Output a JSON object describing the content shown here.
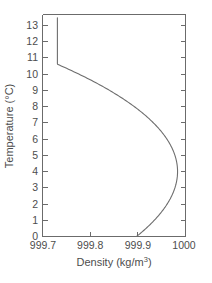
{
  "chart_data": {
    "type": "line",
    "title": "",
    "subtitle": "",
    "xlabel": "Density (kg/m3)",
    "xlabel_base": "Density (kg/m",
    "xlabel_sup": "3",
    "xlabel_tail": ")",
    "ylabel": "Temperature (°C)",
    "xlim": [
      999.66,
      1000.02
    ],
    "ylim": [
      0,
      13.6
    ],
    "xticks": [
      999.7,
      999.8,
      999.9,
      1000
    ],
    "xticklabels": [
      "999.7",
      "999.8",
      "999.9",
      "1000"
    ],
    "yticks": [
      0,
      1,
      2,
      3,
      4,
      5,
      6,
      7,
      8,
      9,
      10,
      11,
      12,
      13
    ],
    "yticklabels": [
      "0",
      "1",
      "2",
      "3",
      "4",
      "5",
      "6",
      "7",
      "8",
      "9",
      "10",
      "11",
      "12",
      "13"
    ],
    "grid": false,
    "legend": false,
    "legend_position": "none",
    "line_color": "#6e6e6e",
    "axis_color": "#6b6b6b",
    "background_color": "#ffffff",
    "orientation": "density-on-x temperature-on-y",
    "annotation": "Density of water versus temperature; maximum density near 4 °C",
    "series": [
      {
        "name": "Water density",
        "x": [
          999.8428,
          999.8684,
          999.8922,
          999.9141,
          999.9342,
          999.9524,
          999.9689,
          999.9835,
          999.9964,
          1000.0075,
          1000.0168,
          1000.0244,
          1000.0303,
          1000.0345,
          1000.037,
          1000.0378,
          1000.037,
          1000.0346,
          1000.0306,
          1000.025,
          1000.0178,
          1000.0091,
          999.9988,
          999.987,
          999.9737,
          999.959,
          999.9428,
          999.9251,
          999.906,
          999.8855,
          999.8636,
          999.8403,
          999.8156,
          999.7896,
          999.7622,
          999.745,
          999.733,
          999.724,
          999.717,
          999.7115,
          999.707,
          999.7035,
          999.7008,
          999.699,
          999.698,
          999.6975
        ],
        "y": [
          0.0,
          0.2,
          0.4,
          0.6,
          0.8,
          1.0,
          1.2,
          1.4,
          1.6,
          1.8,
          2.0,
          2.2,
          2.4,
          2.6,
          2.8,
          3.0,
          3.2,
          3.4,
          3.6,
          3.8,
          4.0,
          4.2,
          4.4,
          4.6,
          4.8,
          5.0,
          5.2,
          5.4,
          5.6,
          5.8,
          6.0,
          6.2,
          6.4,
          6.6,
          6.8,
          7.0,
          7.2,
          7.4,
          7.6,
          7.8,
          8.0,
          8.2,
          8.4,
          8.6,
          8.8,
          9.0
        ],
        "note": "lower branch rendered left-to-right in temperature order"
      }
    ],
    "curve_points": [
      {
        "t": 0.0,
        "d": 999.8428
      },
      {
        "t": 1.0,
        "d": 999.8524
      },
      {
        "t": 2.0,
        "d": 999.8668
      },
      {
        "t": 3.0,
        "d": 999.9653
      },
      {
        "t": 4.0,
        "d": 1000.0
      },
      {
        "t": 5.0,
        "d": 999.965
      },
      {
        "t": 6.0,
        "d": 999.94
      },
      {
        "t": 7.0,
        "d": 999.902
      },
      {
        "t": 8.0,
        "d": 999.849
      },
      {
        "t": 9.0,
        "d": 999.781
      },
      {
        "t": 10.0,
        "d": 999.728
      },
      {
        "t": 11.0,
        "d": 999.708
      },
      {
        "t": 12.0,
        "d": 999.701
      },
      {
        "t": 13.0,
        "d": 999.698
      },
      {
        "t": 13.4,
        "d": 999.6975
      }
    ]
  },
  "axes": {
    "x_tick_labels": [
      "999.7",
      "999.8",
      "999.9",
      "1000"
    ],
    "y_tick_labels": [
      "0",
      "1",
      "2",
      "3",
      "4",
      "5",
      "6",
      "7",
      "8",
      "9",
      "10",
      "11",
      "12",
      "13"
    ],
    "x_title_base": "Density (kg/m",
    "x_title_sup": "3",
    "x_title_tail": ")",
    "y_title": "Temperature (°C)"
  }
}
